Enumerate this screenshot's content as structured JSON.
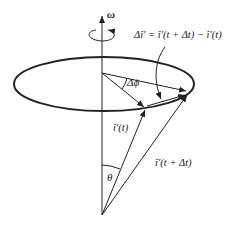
{
  "diagram": {
    "labels": {
      "omega": "ω",
      "delta_i": "Δî′ = î′(t + Δt) − î′(t)",
      "delta_phi": "Δϕ",
      "i_t": "î′(t)",
      "i_t_dt": "î′(t + Δt)",
      "theta": "θ"
    },
    "colors": {
      "stroke": "#222222",
      "background": "#ffffff"
    },
    "geometry": {
      "apex": [
        102,
        215
      ],
      "axis_top": [
        102,
        14
      ],
      "disk_center": [
        102,
        73
      ],
      "ellipse": {
        "cx": 104,
        "cy": 84,
        "rx": 90,
        "ry": 27
      },
      "i_t_tip": [
        146,
        108
      ],
      "i_t_dt_tip": [
        188,
        92
      ]
    }
  }
}
